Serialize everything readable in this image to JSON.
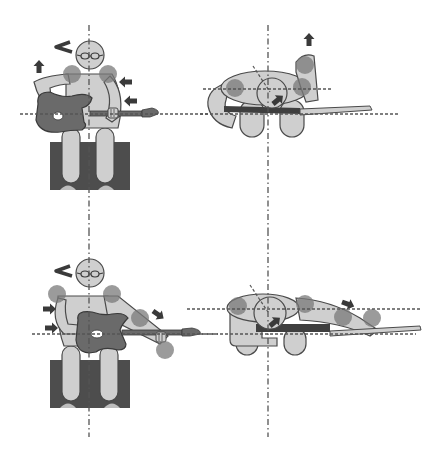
{
  "diagram": {
    "colors": {
      "background": "#ffffff",
      "body_fill": "#cfcfcf",
      "outline": "#4a4a4a",
      "guitar": "#6a6a6a",
      "stool": "#4d4d4d",
      "joint_highlight": "#7a7a7a",
      "axis_line": "#555555",
      "arrow": "#3a3a3a"
    },
    "panels": [
      {
        "id": "top-left",
        "view": "front",
        "posture": "seated, guitar low on right leg"
      },
      {
        "id": "top-right",
        "view": "top/side",
        "posture": "seated, guitar low"
      },
      {
        "id": "bottom-left",
        "view": "front",
        "posture": "seated, guitar raised diagonally"
      },
      {
        "id": "bottom-right",
        "view": "top/side",
        "posture": "seated, arm extended along neck"
      }
    ],
    "annotations": {
      "arrows": [
        "up",
        "left",
        "left",
        "down-right",
        "right",
        "right",
        "diagonal"
      ],
      "reference_lines": "dash-dot vertical body axis; dashed horizontal shoulder/guitar lines"
    }
  }
}
